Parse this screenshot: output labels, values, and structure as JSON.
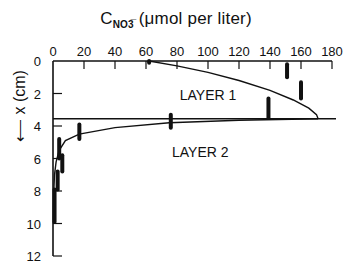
{
  "chart_data": {
    "type": "line",
    "title_main": "C",
    "title_sub": "NO3̅",
    "title_rest": " (μmol per liter)",
    "xlabel": "C_NO3- (µmol per liter)",
    "ylabel": "x (cm)",
    "ylabel_text": "x (cm)",
    "x_axis_position": "top",
    "y_axis_inverted": true,
    "xlim": [
      0,
      180
    ],
    "ylim": [
      0,
      12
    ],
    "x_ticks": [
      0,
      20,
      40,
      60,
      80,
      100,
      120,
      140,
      160,
      180
    ],
    "y_ticks": [
      0,
      2,
      4,
      6,
      8,
      10,
      12
    ],
    "grid": false,
    "layer_boundary_depth": 3.55,
    "annotations": [
      {
        "text": "LAYER 1",
        "x": 100,
        "y": 2.4
      },
      {
        "text": "LAYER 2",
        "x": 95,
        "y": 5.9
      }
    ],
    "series": [
      {
        "name": "Layer 1 model profile",
        "points": [
          [
            62,
            0
          ],
          [
            80,
            0.3
          ],
          [
            100,
            0.7
          ],
          [
            120,
            1.2
          ],
          [
            140,
            1.8
          ],
          [
            155,
            2.4
          ],
          [
            165,
            2.9
          ],
          [
            170,
            3.3
          ],
          [
            171,
            3.55
          ]
        ]
      },
      {
        "name": "Layer 2 model profile",
        "points": [
          [
            171,
            3.55
          ],
          [
            120,
            3.65
          ],
          [
            75,
            3.8
          ],
          [
            40,
            4.1
          ],
          [
            17,
            4.5
          ],
          [
            8,
            4.9
          ],
          [
            4,
            5.5
          ],
          [
            2,
            6.2
          ],
          [
            1,
            7.0
          ],
          [
            0.5,
            8.0
          ],
          [
            0.3,
            10.0
          ]
        ]
      },
      {
        "name": "Measured ranges (bars)",
        "bars": [
          {
            "c": 62,
            "depth_from": 0,
            "depth_to": 0.1
          },
          {
            "c": 151,
            "depth_from": 0.2,
            "depth_to": 1.0
          },
          {
            "c": 160,
            "depth_from": 1.3,
            "depth_to": 2.3
          },
          {
            "c": 139,
            "depth_from": 2.3,
            "depth_to": 3.5
          },
          {
            "c": 76,
            "depth_from": 3.3,
            "depth_to": 4.1
          },
          {
            "c": 17,
            "depth_from": 3.9,
            "depth_to": 4.8
          },
          {
            "c": 4,
            "depth_from": 4.8,
            "depth_to": 6.0
          },
          {
            "c": 6,
            "depth_from": 5.8,
            "depth_to": 6.8
          },
          {
            "c": 3,
            "depth_from": 6.8,
            "depth_to": 7.9
          },
          {
            "c": 1,
            "depth_from": 7.9,
            "depth_to": 9.9
          }
        ]
      }
    ]
  }
}
